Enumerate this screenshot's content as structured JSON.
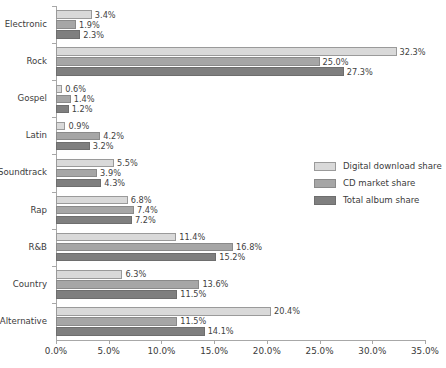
{
  "chart_data": {
    "type": "bar",
    "orientation": "horizontal",
    "title": "",
    "xlabel": "",
    "ylabel": "",
    "xlim": [
      0,
      35
    ],
    "xticks": [
      0,
      5,
      10,
      15,
      20,
      25,
      30,
      35
    ],
    "xtick_labels": [
      "0.0%",
      "5.0%",
      "10.0%",
      "15.0%",
      "20.0%",
      "25.0%",
      "30.0%",
      "35.0%"
    ],
    "grid": false,
    "legend_position": "center-right",
    "categories": [
      "Electronic",
      "Rock",
      "Gospel",
      "Latin",
      "Soundtrack",
      "Rap",
      "R&B",
      "Country",
      "Alternative"
    ],
    "series": [
      {
        "name": "Digital download share",
        "color": "#d9d9d9",
        "values": [
          3.4,
          32.3,
          0.6,
          0.9,
          5.5,
          6.8,
          11.4,
          6.3,
          20.4
        ],
        "labels": [
          "3.4%",
          "32.3%",
          "0.6%",
          "0.9%",
          "5.5%",
          "6.8%",
          "11.4%",
          "6.3%",
          "20.4%"
        ]
      },
      {
        "name": "CD market share",
        "color": "#a6a6a6",
        "values": [
          1.9,
          25.0,
          1.4,
          4.2,
          3.9,
          7.4,
          16.8,
          13.6,
          11.5
        ],
        "labels": [
          "1.9%",
          "25.0%",
          "1.4%",
          "4.2%",
          "3.9%",
          "7.4%",
          "16.8%",
          "13.6%",
          "11.5%"
        ]
      },
      {
        "name": "Total album share",
        "color": "#7f7f7f",
        "values": [
          2.3,
          27.3,
          1.2,
          3.2,
          4.3,
          7.2,
          15.2,
          11.5,
          14.1
        ],
        "labels": [
          "2.3%",
          "27.3%",
          "1.2%",
          "3.2%",
          "4.3%",
          "7.2%",
          "15.2%",
          "11.5%",
          "14.1%"
        ]
      }
    ]
  }
}
